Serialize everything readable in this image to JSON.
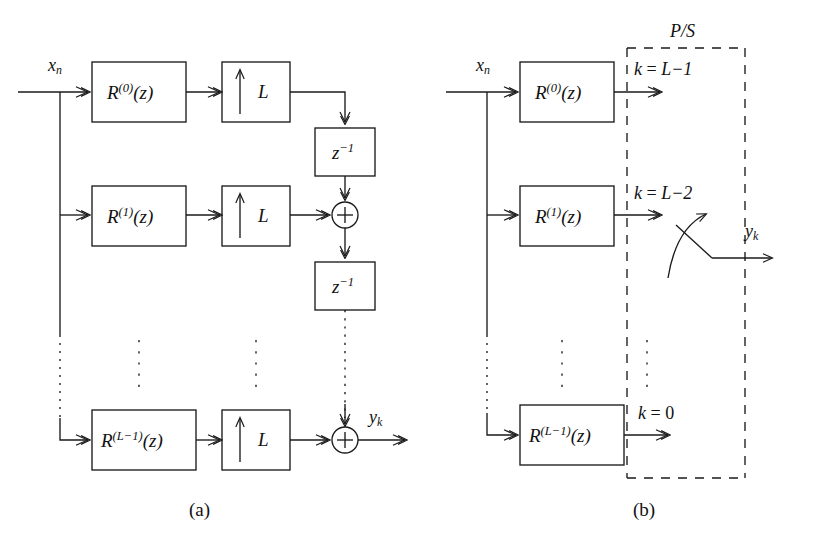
{
  "figure": {
    "type": "block-diagram",
    "line_color": "#1a1a1a",
    "background": "#ffffff"
  },
  "captions": {
    "a": "(a)",
    "b": "(b)"
  },
  "signals": {
    "input": "x",
    "input_sub": "n",
    "output": "y",
    "output_sub": "k"
  },
  "panel_a": {
    "filters": [
      {
        "base": "R",
        "exponent": "(0)",
        "arg": "(z)"
      },
      {
        "base": "R",
        "exponent": "(1)",
        "arg": "(z)"
      },
      {
        "base": "R",
        "exponent": "(L−1)",
        "arg": "(z)"
      }
    ],
    "upsampler_label": "L",
    "upsampler_icon": "up-arrow-icon",
    "delay_label": "z",
    "delay_exponent": "−1",
    "adder_icon": "plus-circle-icon",
    "adder_count": 2,
    "delay_count": 2,
    "ellipsis_icon": "vertical-dots-icon"
  },
  "panel_b": {
    "filters": [
      {
        "base": "R",
        "exponent": "(0)",
        "arg": "(z)"
      },
      {
        "base": "R",
        "exponent": "(1)",
        "arg": "(z)"
      },
      {
        "base": "R",
        "exponent": "(L−1)",
        "arg": "(z)"
      }
    ],
    "ps_label": "P/S",
    "tap_labels": [
      {
        "var": "k",
        "eq": " = ",
        "val": "L−1"
      },
      {
        "var": "k",
        "eq": " = ",
        "val": "L−2"
      },
      {
        "var": "k",
        "eq": " = ",
        "val": "0"
      }
    ],
    "commutator_icon": "rotary-switch-icon",
    "ellipsis_icon": "vertical-dots-icon"
  }
}
